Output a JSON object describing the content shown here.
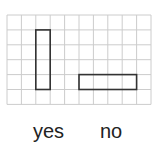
{
  "grid": {
    "cols": 10,
    "rows": 6,
    "x0": 7,
    "y0": 15,
    "cell_w": 14.4,
    "cell_h": 14.9,
    "line_color": "#cccccc",
    "shape_color": "#333333"
  },
  "shapes": [
    {
      "name": "vertical-rectangle",
      "col": 2,
      "row": 1,
      "w": 1,
      "h": 4
    },
    {
      "name": "horizontal-rectangle",
      "col": 5,
      "row": 4,
      "w": 4,
      "h": 1
    }
  ],
  "labels": {
    "yes": "yes",
    "no": "no"
  }
}
